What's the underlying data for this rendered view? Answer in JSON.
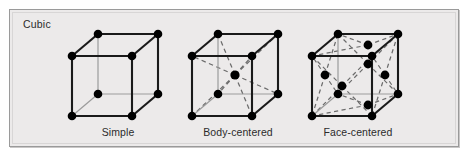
{
  "figure": {
    "group_title": "Cubic",
    "background_color": "#eceaea",
    "border_color": "#9a9a9a",
    "atom_color": "#000000",
    "edge_color": "#1a1a1a",
    "hidden_edge_color": "#8c8c8c",
    "dashed_color": "#6b6b6b"
  },
  "cells": [
    {
      "id": "simple",
      "caption": "Simple",
      "lattice_type": "simple-cubic",
      "atom_count": 8,
      "atoms": "8 corner atoms",
      "dashed_diagonals": false
    },
    {
      "id": "body-centered",
      "caption": "Body-centered",
      "lattice_type": "body-centered-cubic",
      "atom_count": 9,
      "atoms": "8 corner atoms + 1 body-center atom",
      "dashed_diagonals": true
    },
    {
      "id": "face-centered",
      "caption": "Face-centered",
      "lattice_type": "face-centered-cubic",
      "atom_count": 14,
      "atoms": "8 corner atoms + 6 face-center atoms",
      "dashed_diagonals": true
    }
  ],
  "geometry": {
    "comment": "Oblique projection. Front square corners plus offset back square.",
    "front": {
      "x0": 14,
      "y0": 30,
      "x1": 74,
      "y1": 90
    },
    "depth": {
      "dx": 26,
      "dy": -22
    },
    "atom_radius": 4.2
  }
}
